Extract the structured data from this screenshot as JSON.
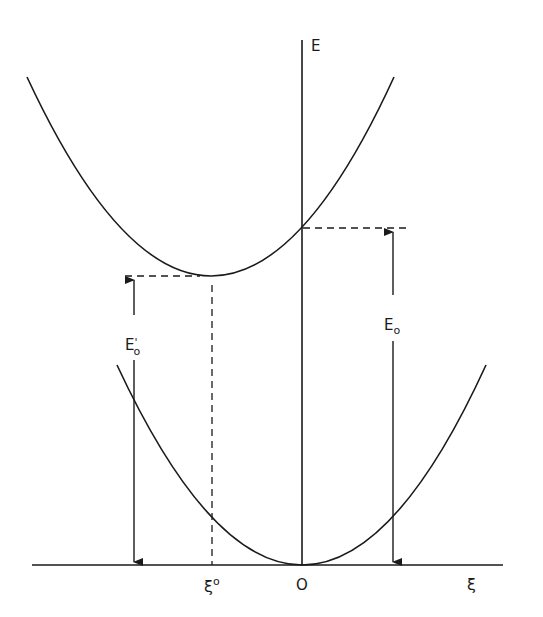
{
  "diagram": {
    "type": "potential-energy-curves",
    "axes": {
      "y_label": "E",
      "x_label": "ξ",
      "origin_label": "O"
    },
    "curves": [
      {
        "name": "upper-parabola",
        "description": "excited-state parabola with minimum displaced to ξ°"
      },
      {
        "name": "lower-parabola",
        "description": "ground-state parabola with minimum at origin"
      }
    ],
    "markers": {
      "xi_zero_label": "ξ",
      "xi_zero_superscript": "o",
      "E0_label": "E",
      "E0_subscript": "o",
      "E0prime_label": "E",
      "E0prime_prime": "'",
      "E0prime_subscript": "o"
    },
    "colors": {
      "line": "#1a1a1a",
      "background": "#ffffff"
    }
  }
}
